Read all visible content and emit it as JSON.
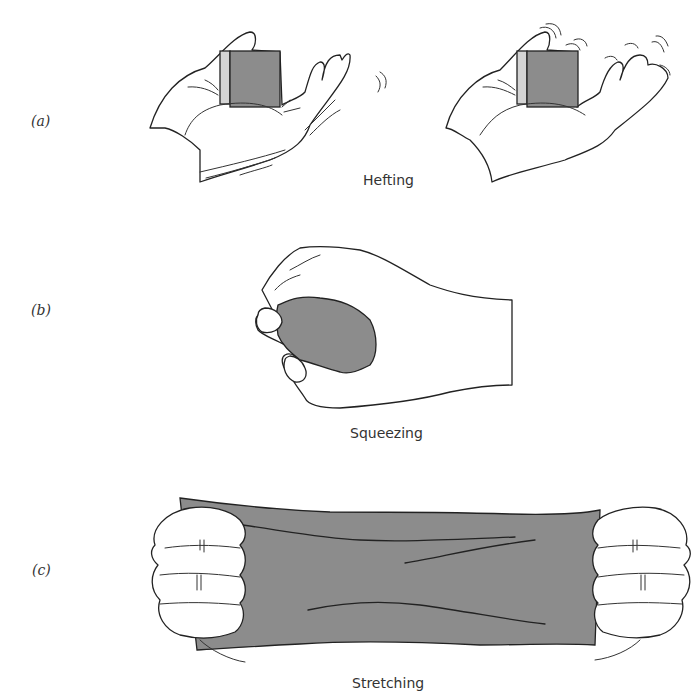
{
  "figure": {
    "panels": [
      {
        "id": "a",
        "label": "(a)",
        "caption": "Hefting"
      },
      {
        "id": "b",
        "label": "(b)",
        "caption": "Squeezing"
      },
      {
        "id": "c",
        "label": "(c)",
        "caption": "Stretching"
      }
    ]
  },
  "colors": {
    "object_fill": "#8c8c8c",
    "object_side_fill": "#d4d4d4",
    "line_ink": "#222222",
    "background": "#ffffff"
  }
}
